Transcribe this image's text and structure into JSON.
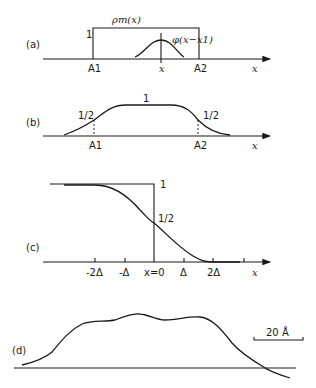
{
  "figure": {
    "panels": [
      {
        "id": "a",
        "label": "(a)",
        "box_label": "ρm(x)",
        "box_height_label": "1",
        "gaussian_label": "φ(x−x1)",
        "tick_labels": [
          "A1",
          "x",
          "A2"
        ],
        "axis_label": "x"
      },
      {
        "id": "b",
        "label": "(b)",
        "plateau_label": "1",
        "half_labels": [
          "1/2",
          "1/2"
        ],
        "tick_labels": [
          "A1",
          "A2"
        ],
        "axis_label": "x"
      },
      {
        "id": "c",
        "label": "(c)",
        "step_label": "1",
        "half_label": "1/2",
        "tick_labels": [
          "-2Δ",
          "-Δ",
          "x=0",
          "Δ",
          "2Δ"
        ],
        "axis_label": "x"
      },
      {
        "id": "d",
        "label": "(d)",
        "scale_bar_label": "20 Å"
      }
    ]
  }
}
